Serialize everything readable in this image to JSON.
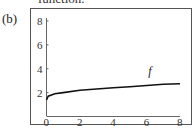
{
  "caption_fragment": "function.",
  "panel_label": "(b)",
  "chart_data": {
    "type": "line",
    "title": "",
    "xlabel": "",
    "ylabel": "",
    "xlim": [
      0,
      8
    ],
    "ylim": [
      0,
      8
    ],
    "x_ticks": [
      "0",
      "2",
      "4",
      "6",
      "8"
    ],
    "y_ticks": [
      "2",
      "4",
      "6",
      "8"
    ],
    "grid": false,
    "series": [
      {
        "name": "f",
        "x": [
          0,
          0.1,
          0.5,
          1,
          2,
          3,
          4,
          5,
          6,
          7,
          8
        ],
        "values": [
          1.4,
          1.7,
          1.9,
          2.0,
          2.2,
          2.3,
          2.4,
          2.5,
          2.6,
          2.7,
          2.75
        ]
      }
    ],
    "annotations": [
      {
        "text": "f",
        "x": 6.1,
        "y": 3.5
      }
    ]
  }
}
